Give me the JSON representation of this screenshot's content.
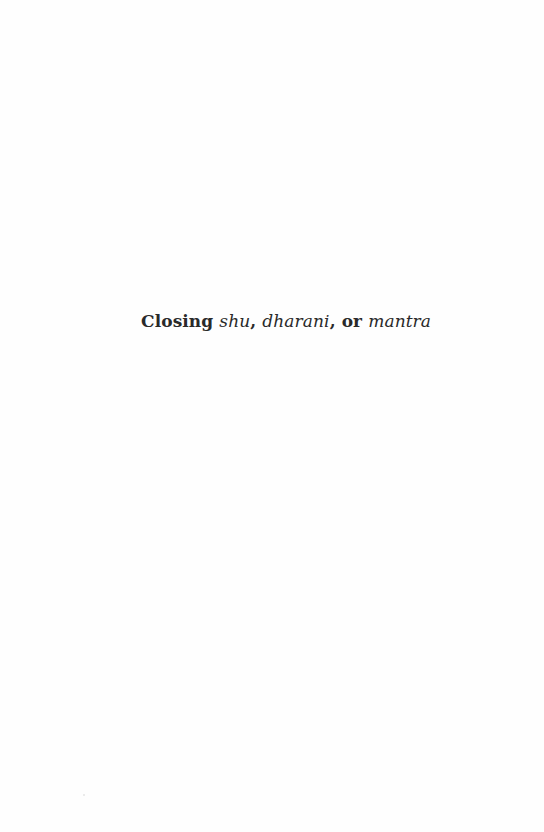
{
  "page": {
    "heading": {
      "parts": [
        {
          "text": "Closing ",
          "style": "bold"
        },
        {
          "text": "shu",
          "style": "italic"
        },
        {
          "text": ", ",
          "style": "bold"
        },
        {
          "text": "dharani",
          "style": "italic"
        },
        {
          "text": ", or ",
          "style": "bold"
        },
        {
          "text": "mantra",
          "style": "italic"
        }
      ],
      "full_text": "Closing shu, dharani, or mantra"
    },
    "colors": {
      "background": "#fefefe",
      "text": "#2a2a2a"
    }
  }
}
